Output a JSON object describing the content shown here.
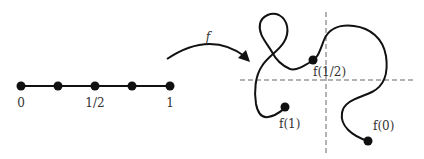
{
  "diagram": {
    "interval": {
      "points": 5,
      "labels": {
        "start": "0",
        "middle": "1/2",
        "end": "1"
      }
    },
    "map_label": "f",
    "curve_labels": {
      "f_half": "f(1/2)",
      "f_one": "f(1)",
      "f_zero": "f(0)"
    },
    "colors": {
      "stroke": "#111111",
      "axis": "#555555",
      "text": "#333333"
    }
  }
}
